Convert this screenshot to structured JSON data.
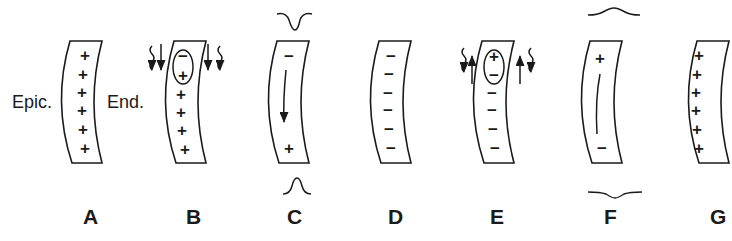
{
  "figure": {
    "side_labels": {
      "epicardium": "Epic.",
      "endocardium": "End."
    },
    "panels": [
      {
        "id": "A",
        "label": "A",
        "charges": [
          "+",
          "+",
          "+",
          "+",
          "+",
          "+"
        ],
        "description": "Resting: all positive"
      },
      {
        "id": "B",
        "label": "B",
        "charges": [
          "−",
          "+",
          "+",
          "+",
          "+",
          "+"
        ],
        "circled_pair": [
          "−",
          "+"
        ],
        "arrows": "downward with wavy arrows on both sides",
        "description": "Depolarization begins at endocardium"
      },
      {
        "id": "C",
        "label": "C",
        "charges": [
          "−",
          "+"
        ],
        "arrow": "down",
        "top_waveform": "negative deflection",
        "bottom_waveform": "positive deflection",
        "description": "Depolarization wave spreading"
      },
      {
        "id": "D",
        "label": "D",
        "charges": [
          "−",
          "−",
          "−",
          "−",
          "−",
          "−"
        ],
        "description": "Fully depolarized"
      },
      {
        "id": "E",
        "label": "E",
        "charges": [
          "+",
          "−",
          "−",
          "−",
          "−",
          "−"
        ],
        "circled_pair": [
          "+",
          "−"
        ],
        "arrows": "upward with wavy arrows on both sides",
        "description": "Repolarization begins"
      },
      {
        "id": "F",
        "label": "F",
        "charges": [
          "+",
          "−"
        ],
        "line": "vertical",
        "top_waveform": "positive deflection",
        "bottom_waveform": "negative deflection",
        "description": "Repolarization wave spreading"
      },
      {
        "id": "G",
        "label": "G",
        "charges": [
          "+",
          "+",
          "+",
          "+",
          "+",
          "+"
        ],
        "description": "Restored resting state"
      }
    ]
  }
}
